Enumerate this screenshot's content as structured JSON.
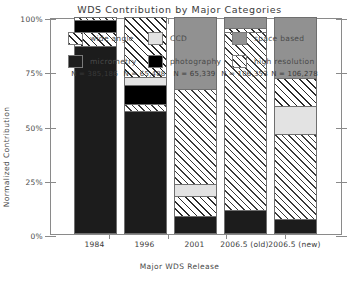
{
  "chart_data": {
    "type": "bar",
    "title": "WDS Contribution by Major Categories",
    "xlabel": "Major WDS Release",
    "ylabel": "Normalized Contribution",
    "categories": [
      "1984",
      "1996",
      "2001",
      "2006.5 (old)",
      "2006.5 (new)"
    ],
    "ytick_labels": [
      "0%",
      "25%",
      "50%",
      "75%",
      "100%"
    ],
    "ytick_values": [
      0,
      25,
      50,
      75,
      100
    ],
    "ylim": [
      0,
      100
    ],
    "grid": false,
    "legend_position": "top-inside",
    "stacked": true,
    "annotations": [
      "N = 385,186",
      "N = 65,488",
      "N = 65,339",
      "N = 106,353",
      "N = 106,278"
    ],
    "series": [
      {
        "name": "micrometry",
        "fill": "micro",
        "color": "#1c1c1c",
        "values": [
          86.5,
          62.0,
          6.0,
          8.0,
          5.0
        ]
      },
      {
        "name": "photography",
        "fill": "photo",
        "color": "#000000",
        "values": [
          5.5,
          7.0,
          0.0,
          0.0,
          0.0
        ]
      },
      {
        "name": "wide angle",
        "fill": "wide",
        "color": "#ffffff",
        "values": [
          5.5,
          25.5,
          6.5,
          0.0,
          0.0
        ]
      },
      {
        "name": "CCD",
        "fill": "ccd",
        "color": "#e3e3e3",
        "values": [
          0.0,
          3.0,
          4.0,
          0.0,
          10.0
        ]
      },
      {
        "name": "high resolution",
        "fill": "high",
        "color": "#ffffff",
        "values": [
          1.5,
          1.5,
          30.0,
          88.0,
          63.0
        ]
      },
      {
        "name": "space based",
        "fill": "space",
        "color": "#919191",
        "values": [
          1.0,
          1.0,
          53.5,
          4.0,
          22.0
        ]
      }
    ],
    "bars": [
      {
        "category": "1984",
        "n_label": "N = 385,186",
        "segments": [
          {
            "name": "high resolution",
            "fill": "high",
            "top_pct": 100.0,
            "bottom_pct": 98.5
          },
          {
            "name": "photography",
            "fill": "photo",
            "top_pct": 98.5,
            "bottom_pct": 93.0
          },
          {
            "name": "wide angle",
            "fill": "wide",
            "top_pct": 93.0,
            "bottom_pct": 86.5
          },
          {
            "name": "micrometry",
            "fill": "micro",
            "top_pct": 86.5,
            "bottom_pct": 0.0
          }
        ]
      },
      {
        "category": "1996",
        "n_label": "N = 65,488",
        "segments": [
          {
            "name": "wide angle",
            "fill": "wide",
            "top_pct": 100.0,
            "bottom_pct": 72.5
          },
          {
            "name": "CCD",
            "fill": "ccd",
            "top_pct": 72.5,
            "bottom_pct": 68.5
          },
          {
            "name": "photography",
            "fill": "photo",
            "top_pct": 68.5,
            "bottom_pct": 60.0
          },
          {
            "name": "high resolution",
            "fill": "high",
            "top_pct": 60.0,
            "bottom_pct": 56.5
          },
          {
            "name": "micrometry",
            "fill": "micro",
            "top_pct": 56.5,
            "bottom_pct": 0.0
          }
        ]
      },
      {
        "category": "2001",
        "n_label": "N = 65,339",
        "segments": [
          {
            "name": "space based",
            "fill": "space",
            "top_pct": 100.0,
            "bottom_pct": 67.0
          },
          {
            "name": "high resolution",
            "fill": "high",
            "top_pct": 67.0,
            "bottom_pct": 23.0
          },
          {
            "name": "CCD",
            "fill": "ccd",
            "top_pct": 23.0,
            "bottom_pct": 17.5
          },
          {
            "name": "wide angle",
            "fill": "wide",
            "top_pct": 17.5,
            "bottom_pct": 8.5
          },
          {
            "name": "micrometry",
            "fill": "micro",
            "top_pct": 8.5,
            "bottom_pct": 0.0
          }
        ]
      },
      {
        "category": "2006.5 (old)",
        "n_label": "N = 106,353",
        "segments": [
          {
            "name": "space based",
            "fill": "space",
            "top_pct": 100.0,
            "bottom_pct": 95.0
          },
          {
            "name": "wide angle",
            "fill": "wide",
            "top_pct": 95.0,
            "bottom_pct": 93.0
          },
          {
            "name": "high resolution",
            "fill": "high",
            "top_pct": 93.0,
            "bottom_pct": 11.0
          },
          {
            "name": "micrometry",
            "fill": "micro",
            "top_pct": 11.0,
            "bottom_pct": 0.0
          }
        ]
      },
      {
        "category": "2006.5 (new)",
        "n_label": "N = 106,278",
        "segments": [
          {
            "name": "space based",
            "fill": "space",
            "top_pct": 100.0,
            "bottom_pct": 72.0
          },
          {
            "name": "wide angle",
            "fill": "wide",
            "top_pct": 72.0,
            "bottom_pct": 59.0
          },
          {
            "name": "CCD",
            "fill": "ccd",
            "top_pct": 59.0,
            "bottom_pct": 46.0
          },
          {
            "name": "high resolution",
            "fill": "high",
            "top_pct": 46.0,
            "bottom_pct": 7.0
          },
          {
            "name": "micrometry",
            "fill": "micro",
            "top_pct": 7.0,
            "bottom_pct": 0.0
          }
        ]
      }
    ],
    "legend": [
      {
        "label": "wide angle",
        "fill": "wide"
      },
      {
        "label": "CCD",
        "fill": "ccd"
      },
      {
        "label": "space based",
        "fill": "space"
      },
      {
        "label": "micrometry",
        "fill": "micro"
      },
      {
        "label": "photography",
        "fill": "photo"
      },
      {
        "label": "high resolution",
        "fill": "high"
      }
    ]
  }
}
